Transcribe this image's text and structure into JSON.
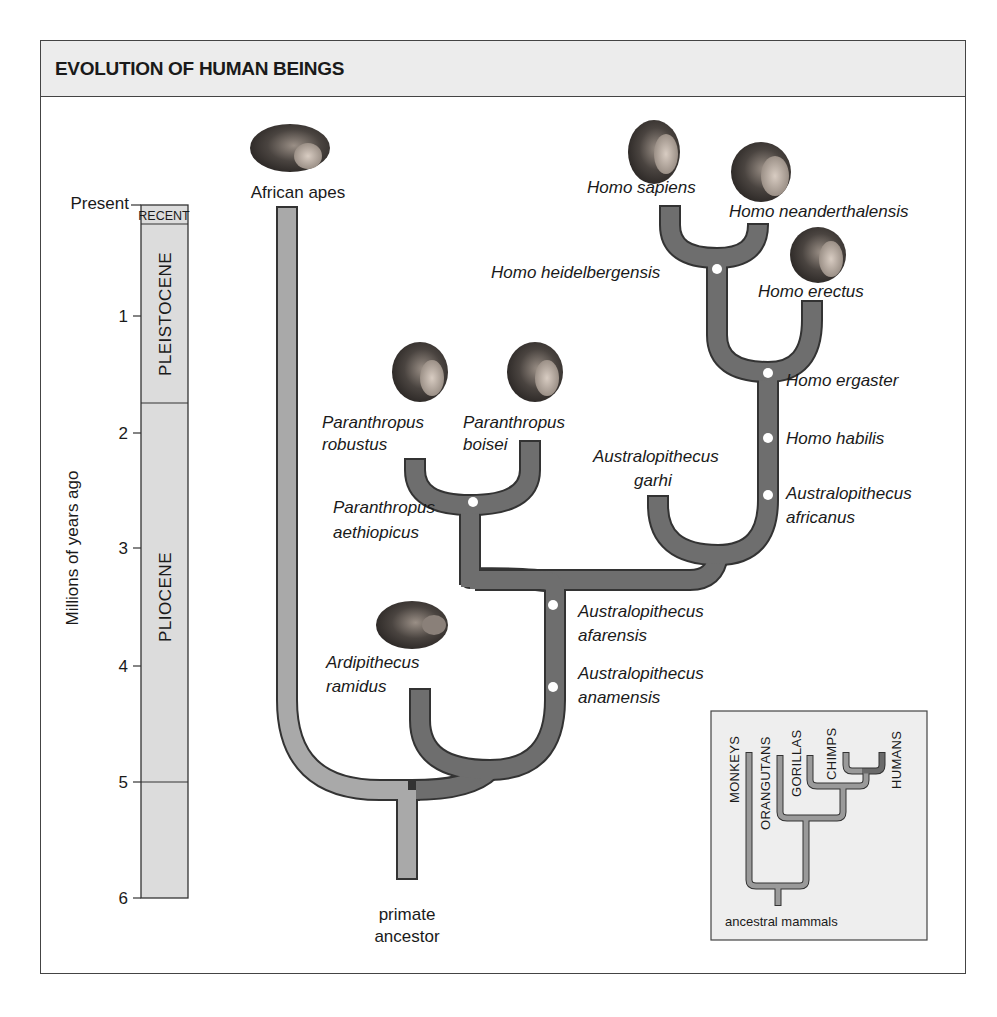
{
  "header": {
    "title": "EVOLUTION OF HUMAN BEINGS"
  },
  "timescale": {
    "axis_label": "Millions of years ago",
    "ticks": [
      "Present",
      "1",
      "2",
      "3",
      "4",
      "5",
      "6"
    ],
    "epochs": [
      {
        "name": "RECENT",
        "from": 0,
        "to": 0.01
      },
      {
        "name": "PLEISTOCENE",
        "from": 0.01,
        "to": 1.8
      },
      {
        "name": "PLIOCENE",
        "from": 1.8,
        "to": 5.3
      }
    ]
  },
  "tree": {
    "root": "primate ancestor",
    "branches": {
      "african_apes": "African apes",
      "ardipithecus": {
        "genus": "Ardipithecus",
        "species": "ramidus"
      },
      "a_anamensis": {
        "genus": "Australopithecus",
        "species": "anamensis"
      },
      "a_afarensis": {
        "genus": "Australopithecus",
        "species": "afarensis"
      },
      "p_aethiopicus": {
        "genus": "Paranthropus",
        "species": "aethiopicus"
      },
      "p_robustus": {
        "genus": "Paranthropus",
        "species": "robustus"
      },
      "p_boisei": {
        "genus": "Paranthropus",
        "species": "boisei"
      },
      "a_garhi": {
        "genus": "Australopithecus",
        "species": "garhi"
      },
      "a_africanus": {
        "genus": "Australopithecus",
        "species": "africanus"
      },
      "h_habilis": "Homo habilis",
      "h_ergaster": "Homo ergaster",
      "h_erectus": "Homo erectus",
      "h_heidelbergensis": "Homo heidelbergensis",
      "h_sapiens": "Homo sapiens",
      "h_neanderthalensis": "Homo neanderthalensis"
    },
    "colors": {
      "hominin_branch": "#6e6e6e",
      "ape_branch": "#a9a9a9",
      "outline": "#333333",
      "node": "#ffffff"
    }
  },
  "inset": {
    "groups": [
      "MONKEYS",
      "ORANGUTANS",
      "GORILLAS",
      "CHIMPS",
      "HUMANS"
    ],
    "root": "ancestral mammals",
    "background": "#eeeeee"
  }
}
